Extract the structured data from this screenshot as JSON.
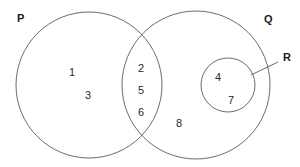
{
  "diagram": {
    "type": "venn",
    "background_color": "#ffffff",
    "stroke_color": "#6b6b6b",
    "label_color": "#1a1a1a",
    "element_color": "#2b2b2b"
  },
  "sets": {
    "p": {
      "label": "P",
      "label_x": 17,
      "label_y": 22,
      "cx": 89,
      "cy": 85,
      "r": 73
    },
    "q": {
      "label": "Q",
      "label_x": 264,
      "label_y": 23,
      "cx": 196,
      "cy": 85,
      "r": 74
    },
    "r": {
      "label": "R",
      "label_x": 283,
      "label_y": 61,
      "cx": 228,
      "cy": 85,
      "r": 27,
      "leader_x1": 278,
      "leader_y1": 62,
      "leader_x2": 251,
      "leader_y2": 75
    }
  },
  "elements": {
    "p_only": [
      {
        "value": "1",
        "x": 72,
        "y": 76
      },
      {
        "value": "3",
        "x": 88,
        "y": 99
      }
    ],
    "intersection_p_q": [
      {
        "value": "2",
        "x": 141,
        "y": 72
      },
      {
        "value": "5",
        "x": 141,
        "y": 94
      },
      {
        "value": "6",
        "x": 141,
        "y": 116
      }
    ],
    "subset_r": [
      {
        "value": "4",
        "x": 218,
        "y": 81
      },
      {
        "value": "7",
        "x": 231,
        "y": 104
      }
    ],
    "q_only": [
      {
        "value": "8",
        "x": 179,
        "y": 127
      }
    ]
  },
  "chart_data": {
    "type": "venn",
    "sets": [
      "P",
      "Q",
      "R"
    ],
    "regions": [
      {
        "name": "P only",
        "members": [
          "1",
          "3"
        ]
      },
      {
        "name": "P and Q intersection",
        "members": [
          "2",
          "5",
          "6"
        ]
      },
      {
        "name": "Q only (outside R)",
        "members": [
          "8"
        ]
      },
      {
        "name": "R (subset of Q)",
        "members": [
          "4",
          "7"
        ]
      }
    ],
    "relations": [
      "R is a proper subset of Q",
      "P intersects Q",
      "R does not intersect P"
    ],
    "universe_members": [
      "1",
      "2",
      "3",
      "4",
      "5",
      "6",
      "7",
      "8"
    ]
  }
}
